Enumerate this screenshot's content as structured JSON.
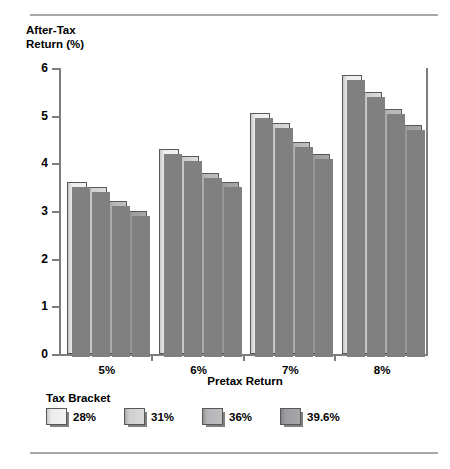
{
  "chart_data": {
    "type": "bar",
    "title": "",
    "ylabel": "After-Tax\nReturn (%)",
    "xlabel": "Pretax Return",
    "categories": [
      "5%",
      "6%",
      "7%",
      "8%"
    ],
    "ylim": [
      0,
      6
    ],
    "yticks": [
      "0",
      "1",
      "2",
      "3",
      "4",
      "5",
      "6"
    ],
    "grid": false,
    "legend_title": "Tax Bracket",
    "legend_position": "bottom-left",
    "series": [
      {
        "name": "28%",
        "values": [
          3.6,
          4.3,
          5.05,
          5.85
        ]
      },
      {
        "name": "31%",
        "values": [
          3.5,
          4.15,
          4.85,
          5.5
        ]
      },
      {
        "name": "36%",
        "values": [
          3.2,
          3.8,
          4.45,
          5.15
        ]
      },
      {
        "name": "39.6%",
        "values": [
          3.0,
          3.6,
          4.2,
          4.8
        ]
      }
    ],
    "series_colors": [
      "#f2f2f2",
      "#dbdbdc",
      "#bfbfc1",
      "#a7a7a9"
    ]
  }
}
